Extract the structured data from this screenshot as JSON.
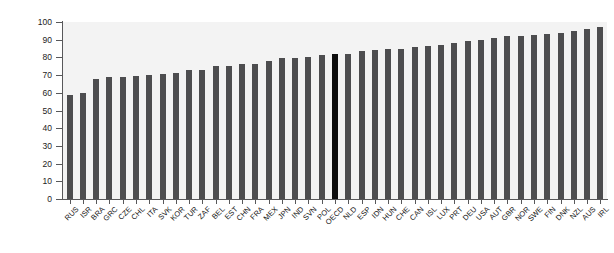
{
  "chart": {
    "title": "",
    "accent_bar_color": "#0d0d0d",
    "bar_color": "#4d4d4f",
    "plot_background": "#f3f3f3",
    "axis_color": "#58585a"
  },
  "chart_data": {
    "type": "bar",
    "title": "",
    "xlabel": "",
    "ylabel": "",
    "ylim": [
      0,
      100
    ],
    "yticks": [
      0,
      10,
      20,
      30,
      40,
      50,
      60,
      70,
      80,
      90,
      100
    ],
    "grid": false,
    "legend": "none",
    "highlight_category": "OECD",
    "categories": [
      "RUS",
      "ISR",
      "BRA",
      "GRC",
      "CZE",
      "CHL",
      "ITA",
      "SVK",
      "KOR",
      "TUR",
      "ZAF",
      "BEL",
      "EST",
      "CHN",
      "FRA",
      "MEX",
      "JPN",
      "IND",
      "SVN",
      "POL",
      "OECD",
      "NLD",
      "ESP",
      "IDN",
      "HUN",
      "CHE",
      "CAN",
      "ISL",
      "LUX",
      "PRT",
      "DEU",
      "USA",
      "AUT",
      "GBR",
      "NOR",
      "SWE",
      "FIN",
      "DNK",
      "NZL",
      "AUS",
      "IRL"
    ],
    "values": [
      59,
      60,
      68,
      69,
      69,
      69.5,
      70,
      70.5,
      71,
      73,
      73,
      75,
      75,
      76,
      76.5,
      78,
      79.5,
      79.5,
      80.5,
      81.5,
      82,
      82,
      83.5,
      84,
      85,
      85,
      86,
      86.5,
      87,
      88,
      89,
      90,
      91,
      92,
      92,
      92.5,
      93,
      94,
      95,
      96,
      97
    ]
  }
}
